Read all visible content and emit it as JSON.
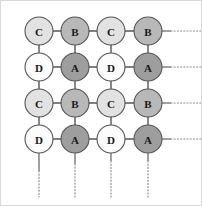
{
  "figure": {
    "width": 202,
    "height": 206,
    "background": "#ffffff",
    "frame_color": "#d9d9d9"
  },
  "style": {
    "node_radius": 14,
    "node_stroke": "#555555",
    "node_stroke_width": 1.1,
    "edge_color": "#555555",
    "edge_width": 1.4,
    "stub_color": "#777777",
    "dotted_color": "#8a8a8a",
    "dotted_width": 1.2,
    "dash_pattern": "1,2.2",
    "label_color": "#1a1a1a",
    "label_size": 11
  },
  "legend_types": [
    {
      "key": "A",
      "label": "A",
      "fill": "#9e9e9e",
      "description": "dark gray site"
    },
    {
      "key": "B",
      "label": "B",
      "fill": "#b8b8b8",
      "description": "medium gray site"
    },
    {
      "key": "C",
      "label": "C",
      "fill": "#e2e2e2",
      "description": "light gray site"
    },
    {
      "key": "D",
      "label": "D",
      "fill": "#fcfcfc",
      "description": "white site"
    }
  ],
  "geometry": {
    "columns_x": [
      38,
      74,
      110,
      147
    ],
    "rows_y": [
      30,
      66,
      102,
      138
    ],
    "right_stub_end": 168,
    "right_dotted_end": 200,
    "bottom_stub_end": 162,
    "bottom_dotted_end": 196,
    "top_open_y": 16,
    "left_open_x": 24
  },
  "chart_data": {
    "type": "diagram",
    "rows": 4,
    "cols": 4,
    "grid": [
      [
        "C",
        "B",
        "C",
        "B"
      ],
      [
        "D",
        "A",
        "D",
        "A"
      ],
      [
        "C",
        "B",
        "C",
        "B"
      ],
      [
        "D",
        "A",
        "D",
        "A"
      ]
    ],
    "nodes": [
      {
        "id": "n-0-0",
        "row": 0,
        "col": 0,
        "label": "C",
        "fill": "#e2e2e2",
        "cx": 38,
        "cy": 30
      },
      {
        "id": "n-0-1",
        "row": 0,
        "col": 1,
        "label": "B",
        "fill": "#b8b8b8",
        "cx": 74,
        "cy": 30
      },
      {
        "id": "n-0-2",
        "row": 0,
        "col": 2,
        "label": "C",
        "fill": "#e2e2e2",
        "cx": 110,
        "cy": 30
      },
      {
        "id": "n-0-3",
        "row": 0,
        "col": 3,
        "label": "B",
        "fill": "#b8b8b8",
        "cx": 147,
        "cy": 30
      },
      {
        "id": "n-1-0",
        "row": 1,
        "col": 0,
        "label": "D",
        "fill": "#fcfcfc",
        "cx": 38,
        "cy": 66
      },
      {
        "id": "n-1-1",
        "row": 1,
        "col": 1,
        "label": "A",
        "fill": "#9e9e9e",
        "cx": 74,
        "cy": 66
      },
      {
        "id": "n-1-2",
        "row": 1,
        "col": 2,
        "label": "D",
        "fill": "#fcfcfc",
        "cx": 110,
        "cy": 66
      },
      {
        "id": "n-1-3",
        "row": 1,
        "col": 3,
        "label": "A",
        "fill": "#9e9e9e",
        "cx": 147,
        "cy": 66
      },
      {
        "id": "n-2-0",
        "row": 2,
        "col": 0,
        "label": "C",
        "fill": "#e2e2e2",
        "cx": 38,
        "cy": 102
      },
      {
        "id": "n-2-1",
        "row": 2,
        "col": 1,
        "label": "B",
        "fill": "#b8b8b8",
        "cx": 74,
        "cy": 102
      },
      {
        "id": "n-2-2",
        "row": 2,
        "col": 2,
        "label": "C",
        "fill": "#e2e2e2",
        "cx": 110,
        "cy": 102
      },
      {
        "id": "n-2-3",
        "row": 2,
        "col": 3,
        "label": "B",
        "fill": "#b8b8b8",
        "cx": 147,
        "cy": 102
      },
      {
        "id": "n-3-0",
        "row": 3,
        "col": 0,
        "label": "D",
        "fill": "#fcfcfc",
        "cx": 38,
        "cy": 138
      },
      {
        "id": "n-3-1",
        "row": 3,
        "col": 1,
        "label": "A",
        "fill": "#9e9e9e",
        "cx": 74,
        "cy": 138
      },
      {
        "id": "n-3-2",
        "row": 3,
        "col": 2,
        "label": "D",
        "fill": "#fcfcfc",
        "cx": 110,
        "cy": 138
      },
      {
        "id": "n-3-3",
        "row": 3,
        "col": 3,
        "label": "A",
        "fill": "#9e9e9e",
        "cx": 147,
        "cy": 138
      }
    ],
    "edges_horizontal": [
      {
        "row": 0,
        "from_col": 0,
        "to_col": 1
      },
      {
        "row": 0,
        "from_col": 1,
        "to_col": 2
      },
      {
        "row": 0,
        "from_col": 2,
        "to_col": 3
      },
      {
        "row": 1,
        "from_col": 0,
        "to_col": 1
      },
      {
        "row": 1,
        "from_col": 1,
        "to_col": 2
      },
      {
        "row": 1,
        "from_col": 2,
        "to_col": 3
      },
      {
        "row": 2,
        "from_col": 0,
        "to_col": 1
      },
      {
        "row": 2,
        "from_col": 1,
        "to_col": 2
      },
      {
        "row": 2,
        "from_col": 2,
        "to_col": 3
      },
      {
        "row": 3,
        "from_col": 0,
        "to_col": 1
      },
      {
        "row": 3,
        "from_col": 1,
        "to_col": 2
      },
      {
        "row": 3,
        "from_col": 2,
        "to_col": 3
      }
    ],
    "edges_vertical": [
      {
        "col": 0,
        "from_row": 0,
        "to_row": 1
      },
      {
        "col": 0,
        "from_row": 1,
        "to_row": 2
      },
      {
        "col": 0,
        "from_row": 2,
        "to_row": 3
      },
      {
        "col": 1,
        "from_row": 0,
        "to_row": 1
      },
      {
        "col": 1,
        "from_row": 1,
        "to_row": 2
      },
      {
        "col": 1,
        "from_row": 2,
        "to_row": 3
      },
      {
        "col": 2,
        "from_row": 0,
        "to_row": 1
      },
      {
        "col": 2,
        "from_row": 1,
        "to_row": 2
      },
      {
        "col": 2,
        "from_row": 2,
        "to_row": 3
      },
      {
        "col": 3,
        "from_row": 0,
        "to_row": 1
      },
      {
        "col": 3,
        "from_row": 1,
        "to_row": 2
      },
      {
        "col": 3,
        "from_row": 2,
        "to_row": 3
      }
    ],
    "continuation_right": [
      {
        "row": 0,
        "y": 30,
        "solid_from": 161,
        "solid_to": 170,
        "dotted_to": 200
      },
      {
        "row": 1,
        "y": 66,
        "solid_from": 161,
        "solid_to": 170,
        "dotted_to": 200
      },
      {
        "row": 2,
        "y": 102,
        "solid_from": 161,
        "solid_to": 170,
        "dotted_to": 200
      },
      {
        "row": 3,
        "y": 138,
        "solid_from": 161,
        "solid_to": 170,
        "dotted_to": 200
      }
    ],
    "continuation_bottom": [
      {
        "col": 0,
        "x": 38,
        "solid_from": 152,
        "solid_to": 170,
        "dotted_to": 196
      },
      {
        "col": 1,
        "x": 74,
        "solid_from": 152,
        "solid_to": 163,
        "dotted_to": 196
      },
      {
        "col": 2,
        "x": 110,
        "solid_from": 152,
        "solid_to": 160,
        "dotted_to": 196
      },
      {
        "col": 3,
        "x": 147,
        "solid_from": 152,
        "solid_to": 160,
        "dotted_to": 196
      }
    ],
    "open_stubs_top": [
      {
        "col": 0,
        "x": 38,
        "from_y": 16,
        "to_y": 16
      }
    ]
  }
}
